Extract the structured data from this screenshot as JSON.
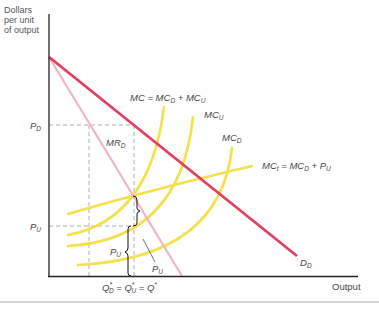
{
  "diagram": {
    "y_axis_label": [
      "Dollars",
      "per unit",
      "of output"
    ],
    "x_axis_label": "Output",
    "price_labels": {
      "p_d": {
        "main": "P",
        "sub": "D"
      },
      "p_u": {
        "main": "P",
        "sub": "U"
      }
    },
    "quantity_label": "Q*D = Q*U = Q*",
    "curves": [
      {
        "id": "demand",
        "label_main": "D",
        "label_sub": "D",
        "color": "#e0405e"
      },
      {
        "id": "marginal-revenue",
        "label_main": "MR",
        "label_sub": "D",
        "color": "#f0b4c4"
      },
      {
        "id": "mc-total",
        "label": "MC = MCD + MCU",
        "color": "#f5e04a"
      },
      {
        "id": "mc-upstream",
        "label_main": "MC",
        "label_sub": "U",
        "color": "#f5e04a"
      },
      {
        "id": "mc-downstream",
        "label_main": "MC",
        "label_sub": "D",
        "color": "#f5e04a"
      },
      {
        "id": "mc-transfer",
        "label": "MCt = MCD + PU",
        "color": "#f5e04a"
      }
    ],
    "brace_labels": [
      {
        "main": "P",
        "sub": "U"
      },
      {
        "main": "P",
        "sub": "U"
      }
    ]
  },
  "text": {
    "mc_eq": "MC = MC",
    "mc_eq_sub1": "D",
    "mc_eq_plus": " + MC",
    "mc_eq_sub2": "U",
    "mcu": "MC",
    "mcu_sub": "U",
    "mcd": "MC",
    "mcd_sub": "D",
    "mct": "MC",
    "mct_sub": "t",
    "mct_eq": " = MC",
    "mct_eq_sub": "D",
    "mct_plus": " + P",
    "mct_plus_sub": "U",
    "mrd": "MR",
    "mrd_sub": "D",
    "pd": "P",
    "pd_sub": "D",
    "pu": "P",
    "pu_sub": "U",
    "brace1": "P",
    "brace1_sub": "U",
    "brace2": "P",
    "brace2_sub": "U",
    "dd": "D",
    "dd_sub": "D",
    "q_q": "Q",
    "q_d_sub": "D",
    "q_eq1": " = Q",
    "q_u_sub": "U",
    "q_eq2": " = Q",
    "star": "*",
    "output": "Output"
  }
}
